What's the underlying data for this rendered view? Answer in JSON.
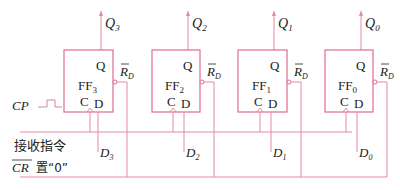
{
  "diagram": {
    "wire_color": "#e58aa3",
    "box_color": "#e26a8c",
    "flipflops": [
      {
        "name": "FF",
        "sub": "3",
        "out": "Q",
        "out_sub": "3",
        "in": "D",
        "in_sub": "3",
        "q_pin": "Q",
        "c_pin": "C",
        "d_pin": "D",
        "reset": "R",
        "reset_sub": "D"
      },
      {
        "name": "FF",
        "sub": "2",
        "out": "Q",
        "out_sub": "2",
        "in": "D",
        "in_sub": "2",
        "q_pin": "Q",
        "c_pin": "C",
        "d_pin": "D",
        "reset": "R",
        "reset_sub": "D"
      },
      {
        "name": "FF",
        "sub": "1",
        "out": "Q",
        "out_sub": "1",
        "in": "D",
        "in_sub": "1",
        "q_pin": "Q",
        "c_pin": "C",
        "d_pin": "D",
        "reset": "R",
        "reset_sub": "D"
      },
      {
        "name": "FF",
        "sub": "0",
        "out": "Q",
        "out_sub": "0",
        "in": "D",
        "in_sub": "0",
        "q_pin": "Q",
        "c_pin": "C",
        "d_pin": "D",
        "reset": "R",
        "reset_sub": "D"
      }
    ],
    "signals": {
      "cp": "CP",
      "receive": "接收指令",
      "cr": "CR",
      "cr_note": "置“0”"
    }
  }
}
